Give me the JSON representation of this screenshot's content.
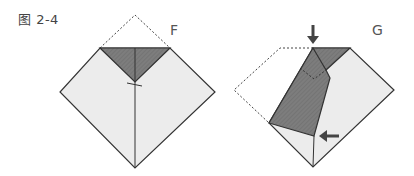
{
  "figure": {
    "title": "图 2-4",
    "panels": [
      {
        "label": "F",
        "description": "Top corner folded down to center; folded-over triangle shaded dark"
      },
      {
        "label": "G",
        "description": "Left flap folded across; arrows indicate push down and push left"
      }
    ],
    "colors": {
      "paper_light": "#ececec",
      "paper_dark": "#7a7a7a",
      "outline": "#333333",
      "dashed": "#444444",
      "arrow": "#444444"
    }
  }
}
